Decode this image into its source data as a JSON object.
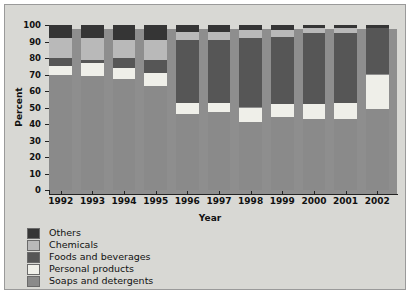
{
  "chart_data": {
    "type": "bar",
    "subtype": "stacked-bar-100-percent",
    "title": "",
    "xlabel": "Year",
    "ylabel": "Percent",
    "ylim": [
      0,
      100
    ],
    "yticks": [
      0,
      10,
      20,
      30,
      40,
      50,
      60,
      70,
      80,
      90,
      100
    ],
    "grid": false,
    "legend_position": "below-plot-left",
    "categories": [
      "1992",
      "1993",
      "1994",
      "1995",
      "1996",
      "1997",
      "1998",
      "1999",
      "2000",
      "2001",
      "2002"
    ],
    "series": [
      {
        "name": "Soaps and detergents",
        "color": "#8a8a8a",
        "values": [
          70,
          69,
          67,
          63,
          46,
          47,
          41,
          44,
          43,
          43,
          49
        ]
      },
      {
        "name": "Personal products",
        "color": "#efefe9",
        "values": [
          5,
          8,
          7,
          8,
          7,
          6,
          9,
          8,
          9,
          10,
          21
        ]
      },
      {
        "name": "Foods and beverages",
        "color": "#565656",
        "values": [
          5,
          2,
          6,
          8,
          38,
          38,
          42,
          41,
          43,
          42,
          28
        ]
      },
      {
        "name": "Chemicals",
        "color": "#b9b9b9",
        "values": [
          12,
          13,
          11,
          12,
          5,
          5,
          5,
          4,
          3,
          3,
          0
        ]
      },
      {
        "name": "Others",
        "color": "#353535",
        "values": [
          8,
          8,
          9,
          9,
          4,
          4,
          3,
          3,
          2,
          2,
          2
        ]
      }
    ]
  },
  "legend": {
    "items": [
      {
        "label": "Others",
        "color": "#353535"
      },
      {
        "label": "Chemicals",
        "color": "#b9b9b9"
      },
      {
        "label": "Foods and beverages",
        "color": "#565656"
      },
      {
        "label": "Personal products",
        "color": "#efefe9"
      },
      {
        "label": "Soaps and detergents",
        "color": "#8a8a8a"
      }
    ]
  },
  "axes": {
    "y_title": "Percent",
    "x_title": "Year"
  },
  "colors": {
    "panel_background": "#8e8e8e",
    "figure_background": "#d8d8d4",
    "axis": "#222222"
  }
}
